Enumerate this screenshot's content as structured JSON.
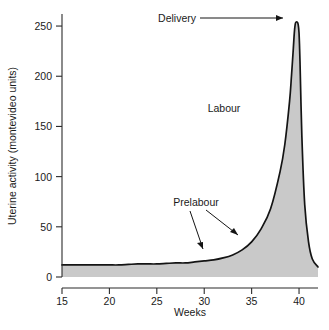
{
  "chart_data": {
    "type": "area",
    "title": "",
    "subtitle": "",
    "xlabel": "Weeks",
    "ylabel": "Uterine activity (montevideo units)",
    "xlim": [
      15,
      42
    ],
    "ylim": [
      0,
      262
    ],
    "grid": false,
    "legend": "none",
    "xticks": [
      15,
      20,
      25,
      30,
      35,
      40
    ],
    "xtick_labels": [
      "15",
      "20",
      "25",
      "30",
      "35",
      "40"
    ],
    "yticks": [
      0,
      50,
      100,
      150,
      200,
      250
    ],
    "ytick_labels": [
      "0",
      "50",
      "100",
      "150",
      "200",
      "250"
    ],
    "fill_color": "#c9c9c9",
    "line_color": "#141414",
    "series": [
      {
        "name": "Uterine activity",
        "x": [
          15,
          16,
          17,
          18,
          19,
          20,
          21,
          22,
          23,
          24,
          25,
          26,
          27,
          28,
          29,
          30,
          31,
          32,
          33,
          34,
          35,
          36,
          37,
          38,
          38.5,
          39,
          39.2,
          39.4,
          39.5,
          39.6,
          39.7,
          39.8,
          39.9,
          40,
          40.1,
          40.3,
          40.6,
          41,
          41.4,
          42
        ],
        "y": [
          12,
          12,
          12,
          12,
          12,
          12,
          12,
          12.5,
          13,
          13,
          13,
          13.5,
          14,
          14,
          15,
          16,
          17,
          19,
          22,
          27,
          35,
          48,
          68,
          105,
          132,
          175,
          200,
          228,
          243,
          252,
          254,
          254,
          252,
          243,
          215,
          140,
          72,
          35,
          18,
          10
        ]
      }
    ],
    "annotations": [
      {
        "label": "Delivery",
        "note": "arrow pointing right to the peak of the curve near 40 weeks / 254 MVU"
      },
      {
        "label": "Labour",
        "note": "text label in the steep rise region of the curve"
      },
      {
        "label": "Prelabour",
        "note": "text label with two arrows pointing to the gradual rise of the curve near 33-37 weeks"
      }
    ]
  },
  "axes": {
    "x_title": "Weeks",
    "y_title": "Uterine activity (montevideo units)"
  }
}
